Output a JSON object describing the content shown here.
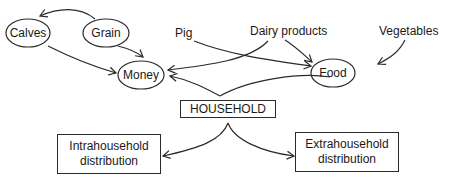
{
  "diagram": {
    "type": "flow",
    "nodes": {
      "calves": {
        "label": "Calves",
        "shape": "ellipse"
      },
      "grain": {
        "label": "Grain",
        "shape": "ellipse"
      },
      "money": {
        "label": "Money",
        "shape": "ellipse"
      },
      "food": {
        "label": "Food",
        "shape": "ellipse"
      },
      "household": {
        "label": "HOUSEHOLD",
        "shape": "rectangle"
      },
      "intra": {
        "label_line1": "Intrahousehold",
        "label_line2": "distribution",
        "shape": "rectangle"
      },
      "extra": {
        "label_line1": "Extrahousehold",
        "label_line2": "distribution",
        "shape": "rectangle"
      }
    },
    "free_labels": {
      "pig": "Pig",
      "dairy": "Dairy products",
      "vegetables": "Vegetables"
    },
    "edges": [
      {
        "from": "Grain",
        "to": "Calves"
      },
      {
        "from": "Grain",
        "to": "Money"
      },
      {
        "from": "Calves",
        "to": "Money"
      },
      {
        "from": "Pig",
        "to": "Food"
      },
      {
        "from": "Dairy products",
        "to": "Money"
      },
      {
        "from": "Dairy products",
        "to": "Food"
      },
      {
        "from": "Vegetables",
        "to": "Food"
      },
      {
        "from": "Food",
        "to": "Money",
        "via": "HOUSEHOLD"
      },
      {
        "from": "HOUSEHOLD",
        "to": "Intrahousehold distribution"
      },
      {
        "from": "HOUSEHOLD",
        "to": "Extrahousehold distribution"
      }
    ]
  }
}
